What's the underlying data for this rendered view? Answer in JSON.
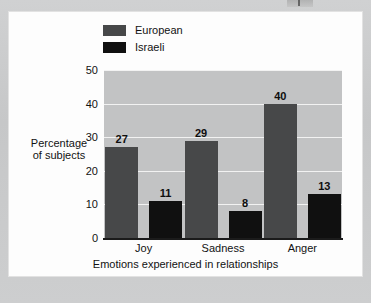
{
  "figure": {
    "background_color": "#fdfdfd",
    "page_color": "#c9cacb"
  },
  "chart_data": {
    "type": "bar",
    "title": "",
    "subtitle": "",
    "xlabel": "Emotions experienced in relationships",
    "ylabel": "Percentage\nof subjects",
    "ylabel_line1": "Percentage",
    "ylabel_line2": "of subjects",
    "categories": [
      "Joy",
      "Sadness",
      "Anger"
    ],
    "series": [
      {
        "name": "European",
        "color": "#474849",
        "values": [
          27,
          29,
          40
        ]
      },
      {
        "name": "Israeli",
        "color": "#101010",
        "values": [
          11,
          8,
          13
        ]
      }
    ],
    "ylim": [
      0,
      50
    ],
    "yticks": [
      0,
      10,
      20,
      30,
      40,
      50
    ],
    "ytick_labels": [
      "0",
      "10",
      "20",
      "30",
      "40",
      "50"
    ],
    "grid": true,
    "grid_color": "#f2f2f2",
    "plot_background": "#c2c3c4",
    "legend_position": "top-left",
    "data_labels": true
  },
  "legend": {
    "items": [
      {
        "label": "European",
        "color": "#474849"
      },
      {
        "label": "Israeli",
        "color": "#101010"
      }
    ]
  }
}
